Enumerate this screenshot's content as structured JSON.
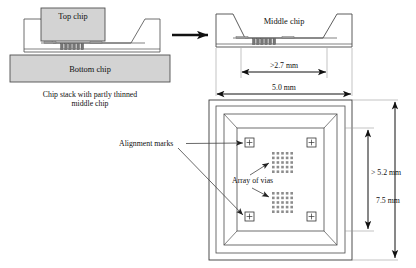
{
  "figure": {
    "panels": {
      "left_cross_section": {
        "name": "chip-stack-cross-section",
        "labels": {
          "top_chip": "Top chip",
          "bottom_chip": "Bottom chip"
        },
        "caption_line1": "Chip stack with partly thinned",
        "caption_line2": "middle chip"
      },
      "right_cross_section": {
        "name": "middle-chip-cross-section",
        "labels": {
          "middle_chip": "Middle chip"
        },
        "dimensions": [
          {
            "label": ">2.7 mm",
            "orientation": "horizontal",
            "meaning": "thinned cavity width"
          },
          {
            "label": "5.0 mm",
            "orientation": "horizontal",
            "meaning": "middle chip width"
          }
        ]
      },
      "plan_view": {
        "name": "middle-chip-plan-view",
        "annotations": [
          {
            "label": "Alignment marks",
            "target": "alignment-mark",
            "count": 4
          },
          {
            "label": "Array of vias",
            "target": "via-array",
            "count": 2
          }
        ],
        "dimensions": [
          {
            "label": "> 5.2 mm",
            "orientation": "vertical",
            "meaning": "cavity height"
          },
          {
            "label": "7.5 mm",
            "orientation": "vertical",
            "meaning": "chip height"
          }
        ]
      }
    },
    "colors": {
      "chip_fill": "#d3d3d3",
      "outline": "#4a4a4a",
      "dimension": "#111111",
      "via": "#8d8d8d",
      "background": "#ffffff"
    }
  }
}
